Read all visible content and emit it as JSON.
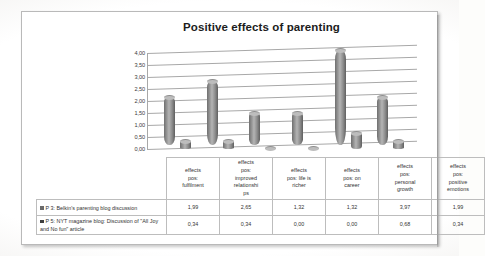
{
  "chart_data": {
    "type": "bar",
    "title": "Positive effects of parenting",
    "xlabel": "",
    "ylabel": "",
    "ylim": [
      0,
      4
    ],
    "grid": true,
    "legend_position": "table-left",
    "style": "3d-cylinder",
    "categories": [
      "effects pos: fulfilment",
      "effects pos: improved relationships",
      "effects pos: life is richer",
      "effects pos: on career",
      "effects pos: personal growth",
      "effects pos: positive emotions"
    ],
    "ytick_labels": [
      "0,00",
      "0,50",
      "1,00",
      "1,50",
      "2,00",
      "2,50",
      "3,00",
      "3,50",
      "4,00"
    ],
    "ytick_values": [
      0,
      0.5,
      1,
      1.5,
      2,
      2.5,
      3,
      3.5,
      4
    ],
    "series": [
      {
        "name": "P 3: Belkin's parenting blog discussion",
        "values": [
          1.99,
          2.65,
          1.32,
          1.32,
          3.97,
          1.99
        ],
        "labels": [
          "1,99",
          "2,65",
          "1,32",
          "1,32",
          "3,97",
          "1,99"
        ],
        "color": "#6a6a6a"
      },
      {
        "name": "P 5: NYT magazine blog: Discussion of \"All Joy and No fun\" article",
        "values": [
          0.34,
          0.34,
          0.0,
          0.0,
          0.68,
          0.34
        ],
        "labels": [
          "0,34",
          "0,34",
          "0,00",
          "0,00",
          "0,68",
          "0,34"
        ],
        "color": "#3f3f3f"
      }
    ]
  },
  "categories_display": [
    {
      "l1": "effects",
      "l2": "pos:",
      "l3": "fulfilment",
      "l4": ""
    },
    {
      "l1": "effects",
      "l2": "pos:",
      "l3": "improved",
      "l4": "relationshi",
      "l5": "ps"
    },
    {
      "l1": "effects",
      "l2": "pos: life is",
      "l3": "richer",
      "l4": ""
    },
    {
      "l1": "effects",
      "l2": "pos: on",
      "l3": "career",
      "l4": ""
    },
    {
      "l1": "effects",
      "l2": "pos:",
      "l3": "personal",
      "l4": "growth"
    },
    {
      "l1": "effects",
      "l2": "pos:",
      "l3": "positive",
      "l4": "emotions"
    }
  ]
}
